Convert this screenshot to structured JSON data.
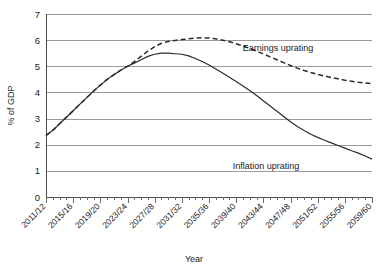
{
  "chart_data": {
    "type": "line",
    "title": "",
    "xlabel": "Year",
    "ylabel": "% of GDP",
    "ylim": [
      0,
      7
    ],
    "yticks": [
      0,
      1,
      2,
      3,
      4,
      5,
      6,
      7
    ],
    "grid": true,
    "legend_position": "inline-annotation",
    "x": [
      "2011/12",
      "2012/13",
      "2013/14",
      "2014/15",
      "2015/16",
      "2016/17",
      "2017/18",
      "2018/19",
      "2019/20",
      "2020/21",
      "2021/22",
      "2022/23",
      "2023/24",
      "2024/25",
      "2025/26",
      "2026/27",
      "2027/28",
      "2028/29",
      "2029/30",
      "2030/31",
      "2031/32",
      "2032/33",
      "2033/34",
      "2034/35",
      "2035/36",
      "2036/37",
      "2037/38",
      "2038/39",
      "2039/40",
      "2040/41",
      "2041/42",
      "2042/43",
      "2043/44",
      "2044/45",
      "2045/46",
      "2046/47",
      "2047/48",
      "2048/49",
      "2049/50",
      "2050/51",
      "2051/52",
      "2052/53",
      "2053/54",
      "2054/55",
      "2055/56",
      "2056/57",
      "2057/58",
      "2058/59",
      "2059/60"
    ],
    "xtick_labels": [
      "2011/12",
      "2015/16",
      "2019/20",
      "2023/24",
      "2027/28",
      "2031/32",
      "2035/36",
      "2039/40",
      "2043/44",
      "2047/48",
      "2051/52",
      "2055/56",
      "2059/60"
    ],
    "xtick_interval": 4,
    "series": [
      {
        "name": "Earnings uprating",
        "style": "dashed",
        "color": "#2b2b2b",
        "annotation": "Earnings uprating",
        "values": [
          2.35,
          2.55,
          2.8,
          3.05,
          3.3,
          3.55,
          3.8,
          4.05,
          4.28,
          4.5,
          4.68,
          4.85,
          5.0,
          5.18,
          5.38,
          5.58,
          5.75,
          5.88,
          5.95,
          5.99,
          6.02,
          6.05,
          6.08,
          6.09,
          6.08,
          6.05,
          6.0,
          5.94,
          5.86,
          5.78,
          5.68,
          5.58,
          5.47,
          5.36,
          5.25,
          5.14,
          5.03,
          4.93,
          4.84,
          4.76,
          4.69,
          4.63,
          4.57,
          4.52,
          4.47,
          4.43,
          4.39,
          4.36,
          4.33
        ]
      },
      {
        "name": "Inflation uprating",
        "style": "solid",
        "color": "#2b2b2b",
        "annotation": "Inflation uprating",
        "values": [
          2.35,
          2.55,
          2.8,
          3.05,
          3.3,
          3.55,
          3.8,
          4.05,
          4.28,
          4.5,
          4.68,
          4.85,
          5.0,
          5.12,
          5.25,
          5.38,
          5.46,
          5.5,
          5.5,
          5.48,
          5.46,
          5.4,
          5.3,
          5.18,
          5.05,
          4.9,
          4.74,
          4.58,
          4.42,
          4.25,
          4.07,
          3.88,
          3.68,
          3.48,
          3.28,
          3.08,
          2.88,
          2.7,
          2.54,
          2.4,
          2.28,
          2.17,
          2.07,
          1.97,
          1.87,
          1.77,
          1.68,
          1.57,
          1.45
        ]
      }
    ],
    "annotations": [
      {
        "text": "Earnings uprating",
        "x_pixel": 278,
        "y_pixel": 51
      },
      {
        "text": "Inflation uprating",
        "x_pixel": 266,
        "y_pixel": 169
      }
    ]
  }
}
